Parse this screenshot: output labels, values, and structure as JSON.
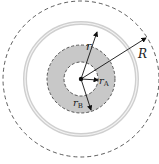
{
  "diagram": {
    "labels": {
      "r": "r",
      "R": "R",
      "rA_main": "r",
      "rA_sub": "A",
      "rB_main": "r",
      "rB_sub": "B"
    },
    "colors": {
      "shaded_annulus": "#c8c8c8",
      "ring": "#d0d0d0",
      "dashed": "#333333",
      "arrow": "#111111"
    }
  }
}
